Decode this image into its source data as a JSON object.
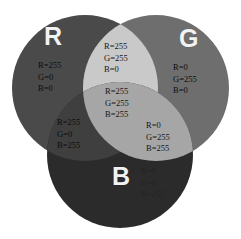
{
  "diagram": {
    "type": "venn-3-circle",
    "background": "#ffffff",
    "rendering": "grayscale"
  },
  "circles": [
    {
      "id": "red",
      "letter": "R",
      "name": "red-circle",
      "cx": 85,
      "cy": 88,
      "r": 73,
      "fill": "#4a4a4a"
    },
    {
      "id": "green",
      "letter": "G",
      "name": "green-circle",
      "cx": 156,
      "cy": 88,
      "r": 73,
      "fill": "#6e6e6e"
    },
    {
      "id": "blue",
      "letter": "B",
      "name": "blue-circle",
      "cx": 120,
      "cy": 155,
      "r": 73,
      "fill": "#2b2b2b"
    }
  ],
  "regions": [
    {
      "id": "red-only",
      "label": "red-only-region",
      "fill": "#4a4a4a",
      "values": {
        "R": "R=255",
        "G": "G=0",
        "B": "B=0"
      }
    },
    {
      "id": "green-only",
      "label": "green-only-region",
      "fill": "#6e6e6e",
      "values": {
        "R": "R=0",
        "G": "G=255",
        "B": "B=0"
      }
    },
    {
      "id": "blue-only",
      "label": "blue-only-region",
      "fill": "#2b2b2b",
      "values": {
        "R": "R=0",
        "G": "G=0",
        "B": "B=255"
      }
    },
    {
      "id": "yellow",
      "label": "red-green-overlap-region",
      "fill": "#c9c9c9",
      "values": {
        "R": "R=255",
        "G": "G=255",
        "B": "B=0"
      }
    },
    {
      "id": "magenta",
      "label": "red-blue-overlap-region",
      "fill": "#3f3f3f",
      "values": {
        "R": "R=255",
        "G": "G=0",
        "B": "B=255"
      }
    },
    {
      "id": "cyan",
      "label": "green-blue-overlap-region",
      "fill": "#a6a6a6",
      "values": {
        "R": "R=0",
        "G": "G=255",
        "B": "B=255"
      }
    },
    {
      "id": "white",
      "label": "all-three-overlap-region",
      "fill": "#f0f0f0",
      "values": {
        "R": "R=255",
        "G": "G=255",
        "B": "B=255"
      }
    }
  ],
  "colors": {
    "page_background": "#ffffff",
    "letter_text": "#f2f2f2",
    "value_text": "#141414"
  }
}
